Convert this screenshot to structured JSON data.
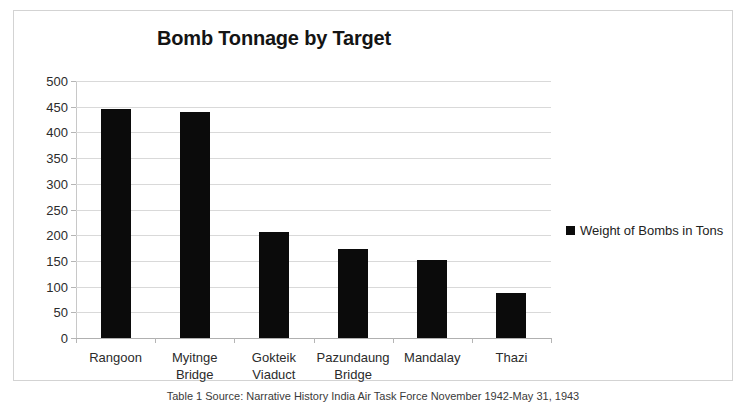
{
  "chart_data": {
    "type": "bar",
    "title": "Bomb Tonnage by Target",
    "categories": [
      "Rangoon",
      "Myitnge Bridge",
      "Gokteik Viaduct",
      "Pazundaung Bridge",
      "Mandalay",
      "Thazi"
    ],
    "category_lines": [
      [
        "Rangoon"
      ],
      [
        "Myitnge",
        "Bridge"
      ],
      [
        "Gokteik",
        "Viaduct"
      ],
      [
        "Pazundaung",
        "Bridge"
      ],
      [
        "Mandalay"
      ],
      [
        "Thazi"
      ]
    ],
    "series": [
      {
        "name": "Weight of Bombs in Tons",
        "color": "#0b0b0b",
        "values": [
          446,
          439,
          207,
          173,
          151,
          87
        ]
      }
    ],
    "values": [
      446,
      439,
      207,
      173,
      151,
      87
    ],
    "xlabel": "",
    "ylabel": "",
    "ylim": [
      0,
      500
    ],
    "ytick_step": 50,
    "yticks": [
      500,
      450,
      400,
      350,
      300,
      250,
      200,
      150,
      100,
      50,
      0
    ],
    "ytick_labels": [
      "500",
      "450",
      "400",
      "350",
      "300",
      "250",
      "200",
      "150",
      "100",
      "50",
      "0"
    ],
    "grid": true,
    "grid_axis": "y",
    "legend": {
      "position": "right",
      "entries": [
        {
          "label": "Weight of Bombs in Tons",
          "color": "#0b0b0b",
          "marker": "square"
        }
      ]
    },
    "annotations": []
  },
  "legend": {
    "entry_label": "Weight of Bombs in Tons"
  },
  "caption": {
    "text": "Table 1 Source: Narrative History India Air Task Force November 1942-May 31, 1943"
  },
  "colors": {
    "bar": "#0b0b0b",
    "grid": "#d9d9d9",
    "frame": "#d3d3d3",
    "text": "#2b2b2b"
  }
}
